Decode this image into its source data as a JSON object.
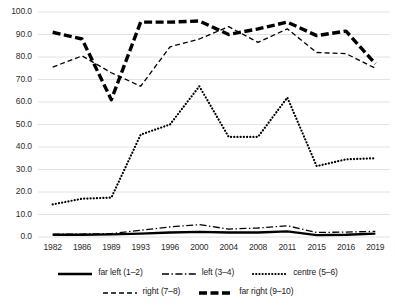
{
  "chart_data": {
    "type": "line",
    "title": "",
    "xlabel": "",
    "ylabel": "",
    "ylim": [
      0.0,
      100.0
    ],
    "ytick_labels": [
      "100.0",
      "90.0",
      "80.0",
      "70.0",
      "60.0",
      "50.0",
      "40.0",
      "30.0",
      "20.0",
      "10.0",
      "0.0"
    ],
    "ytick_values": [
      100.0,
      90.0,
      80.0,
      70.0,
      60.0,
      50.0,
      40.0,
      30.0,
      20.0,
      10.0,
      0.0
    ],
    "grid": true,
    "legend_position": "bottom",
    "categories": [
      "1982",
      "1986",
      "1989",
      "1993",
      "1996",
      "2000",
      "2004",
      "2008",
      "2011",
      "2015",
      "2016",
      "2019"
    ],
    "x": [
      1982,
      1986,
      1989,
      1993,
      1996,
      2000,
      2004,
      2008,
      2011,
      2015,
      2016,
      2019
    ],
    "series": [
      {
        "name": "far left (1–2)",
        "style": "solid",
        "values": [
          1.0,
          1.0,
          1.2,
          1.5,
          2.0,
          2.3,
          2.0,
          2.0,
          2.5,
          0.8,
          1.0,
          1.5
        ]
      },
      {
        "name": "left (3–4)",
        "style": "dash-dot",
        "values": [
          1.2,
          1.3,
          1.5,
          3.0,
          4.5,
          5.5,
          3.5,
          4.0,
          5.0,
          2.0,
          2.2,
          2.5
        ]
      },
      {
        "name": "centre (5–6)",
        "style": "dotted",
        "values": [
          14.5,
          17.0,
          17.5,
          45.5,
          50.0,
          67.0,
          44.5,
          44.5,
          62.0,
          31.5,
          34.5,
          35.0
        ]
      },
      {
        "name": "right (7–8)",
        "style": "dashed",
        "values": [
          75.5,
          80.5,
          73.0,
          67.0,
          84.5,
          88.0,
          93.5,
          86.5,
          92.5,
          82.0,
          81.5,
          75.0
        ]
      },
      {
        "name": "far right (9–10)",
        "style": "heavy-dashed",
        "values": [
          91.0,
          88.0,
          61.0,
          95.5,
          95.5,
          96.0,
          90.0,
          92.5,
          95.5,
          89.5,
          91.5,
          77.0
        ]
      }
    ]
  }
}
